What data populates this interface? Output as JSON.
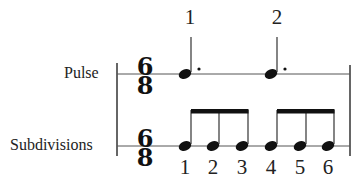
{
  "rows": {
    "pulse": {
      "label": "Pulse",
      "time_signature": {
        "top": "6",
        "bottom": "8"
      },
      "notes": "dotted-quarter x2",
      "counts": [
        "1",
        "2"
      ]
    },
    "subdivisions": {
      "label": "Subdivisions",
      "time_signature": {
        "top": "6",
        "bottom": "8"
      },
      "notes": "eighth notes x6 beamed in two groups of 3",
      "counts": [
        "1",
        "2",
        "3",
        "4",
        "5",
        "6"
      ]
    }
  },
  "colors": {
    "ink": "#111111",
    "line": "#555555",
    "background": "#ffffff"
  }
}
